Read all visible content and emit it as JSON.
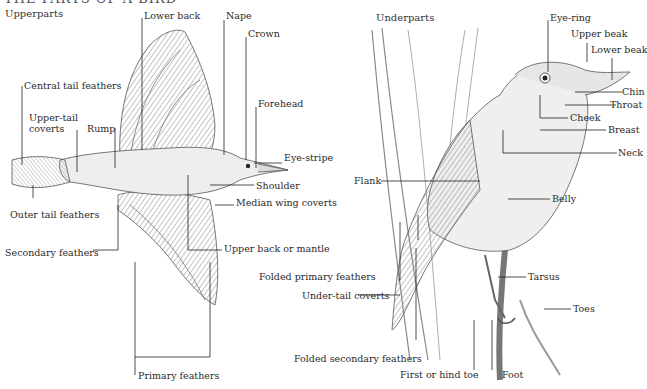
{
  "title": "THE PARTS OF A BIRD",
  "panels": {
    "upperparts": {
      "heading": "Upperparts",
      "labels": [
        {
          "id": "lower-back",
          "text": "Lower back"
        },
        {
          "id": "nape",
          "text": "Nape"
        },
        {
          "id": "crown",
          "text": "Crown"
        },
        {
          "id": "forehead",
          "text": "Forehead"
        },
        {
          "id": "central-tail-feathers",
          "text": "Central tail feathers"
        },
        {
          "id": "upper-tail-coverts",
          "text": "Upper-tail coverts"
        },
        {
          "id": "rump",
          "text": "Rump"
        },
        {
          "id": "eye-stripe",
          "text": "Eye-stripe"
        },
        {
          "id": "shoulder",
          "text": "Shoulder"
        },
        {
          "id": "median-wing-coverts",
          "text": "Median wing coverts"
        },
        {
          "id": "outer-tail-feathers",
          "text": "Outer tail feathers"
        },
        {
          "id": "upper-back-or-mantle",
          "text": "Upper back or mantle"
        },
        {
          "id": "secondary-feathers",
          "text": "Secondary feathers"
        },
        {
          "id": "primary-feathers",
          "text": "Primary feathers"
        }
      ]
    },
    "underparts": {
      "heading": "Underparts",
      "labels": [
        {
          "id": "eye-ring",
          "text": "Eye-ring"
        },
        {
          "id": "upper-beak",
          "text": "Upper beak"
        },
        {
          "id": "lower-beak",
          "text": "Lower beak"
        },
        {
          "id": "chin",
          "text": "Chin"
        },
        {
          "id": "throat",
          "text": "Throat"
        },
        {
          "id": "cheek",
          "text": "Cheek"
        },
        {
          "id": "breast",
          "text": "Breast"
        },
        {
          "id": "neck",
          "text": "Neck"
        },
        {
          "id": "flank",
          "text": "Flank"
        },
        {
          "id": "belly",
          "text": "Belly"
        },
        {
          "id": "folded-primary-feathers",
          "text": "Folded primary feathers"
        },
        {
          "id": "under-tail-coverts",
          "text": "Under-tail coverts"
        },
        {
          "id": "tarsus",
          "text": "Tarsus"
        },
        {
          "id": "toes",
          "text": "Toes"
        },
        {
          "id": "folded-secondary-feathers",
          "text": "Folded secondary feathers"
        },
        {
          "id": "first-or-hind-toe",
          "text": "First or hind toe"
        },
        {
          "id": "foot",
          "text": "Foot"
        }
      ]
    }
  },
  "colors": {
    "line": "#222222",
    "ink": "#555555",
    "shade": "#9a9a9a",
    "paper": "#ffffff"
  }
}
